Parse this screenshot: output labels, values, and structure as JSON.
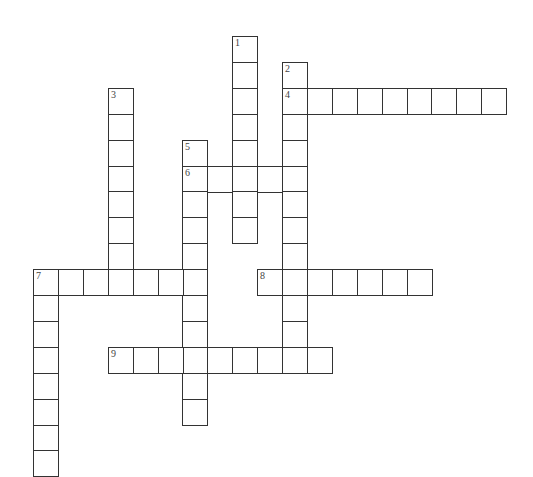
{
  "puzzle": {
    "type": "crossword",
    "origin_x": 33,
    "origin_y": 36,
    "step_x": 24.9,
    "step_y": 25.9,
    "border_color": "#333333",
    "entries": [
      {
        "number": "1",
        "direction": "down",
        "row": 0,
        "col": 8,
        "length": 8
      },
      {
        "number": "2",
        "direction": "down",
        "row": 1,
        "col": 10,
        "length": 11
      },
      {
        "number": "3",
        "direction": "down",
        "row": 2,
        "col": 3,
        "length": 8
      },
      {
        "number": "4",
        "direction": "across",
        "row": 2,
        "col": 10,
        "length": 9
      },
      {
        "number": "5",
        "direction": "down",
        "row": 4,
        "col": 6,
        "length": 11
      },
      {
        "number": "6",
        "direction": "across",
        "row": 5,
        "col": 6,
        "length": 5
      },
      {
        "number": "7",
        "direction": "across",
        "row": 9,
        "col": 0,
        "length": 7
      },
      {
        "number": "7",
        "direction": "down",
        "row": 9,
        "col": 0,
        "length": 8
      },
      {
        "number": "8",
        "direction": "across",
        "row": 9,
        "col": 9,
        "length": 7
      },
      {
        "number": "9",
        "direction": "across",
        "row": 12,
        "col": 3,
        "length": 9
      }
    ]
  }
}
